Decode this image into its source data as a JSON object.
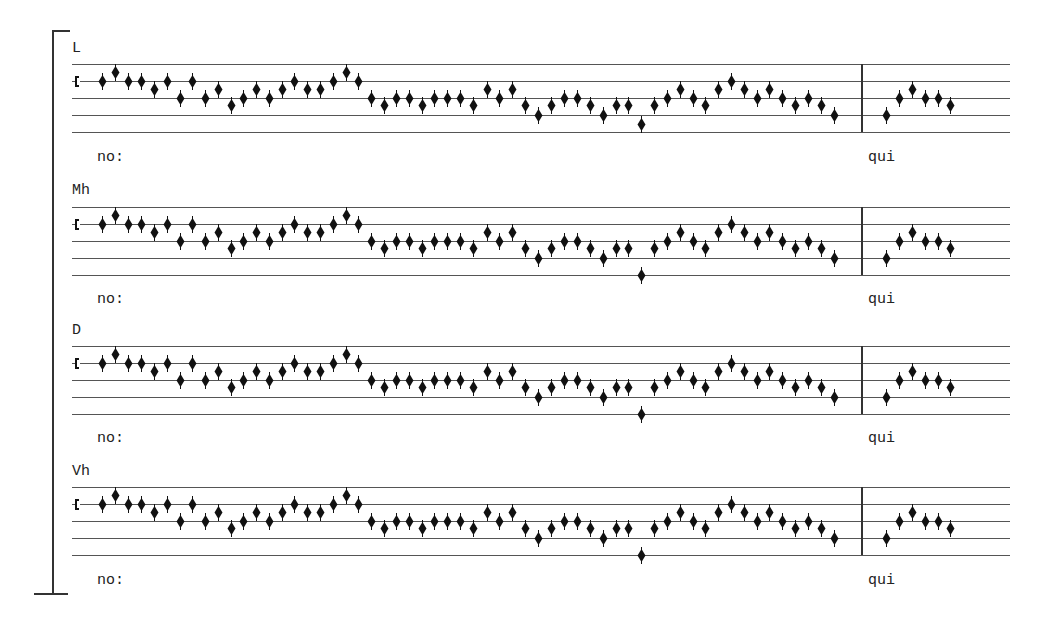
{
  "document": {
    "type": "chant-edition-comparison",
    "staff_line_offsets": [
      0,
      17,
      34,
      51,
      68
    ],
    "staff_left": 72,
    "staff_right": 1010,
    "barline_x": 861,
    "clef": {
      "type": "C-clef",
      "x": 77,
      "line_offset": 17
    },
    "ink_color": "#111111",
    "line_color": "#555555"
  },
  "systems": [
    {
      "label": "L",
      "top": 64,
      "label_y": 40,
      "lyric_y": 149,
      "lyrics": [
        {
          "text": "no:",
          "x": 97
        },
        {
          "text": "qui",
          "x": 868
        }
      ],
      "variant_note": {
        "x": 641,
        "offset": 60
      }
    },
    {
      "label": "Mh",
      "top": 207,
      "label_y": 182,
      "lyric_y": 291,
      "lyrics": [
        {
          "text": "no:",
          "x": 97
        },
        {
          "text": "qui",
          "x": 868
        }
      ],
      "variant_note": {
        "x": 641,
        "offset": 68
      }
    },
    {
      "label": "D",
      "top": 346,
      "label_y": 322,
      "lyric_y": 430,
      "lyrics": [
        {
          "text": "no:",
          "x": 97
        },
        {
          "text": "qui",
          "x": 868
        }
      ],
      "variant_note": {
        "x": 641,
        "offset": 68
      }
    },
    {
      "label": "Vh",
      "top": 487,
      "label_y": 463,
      "lyric_y": 572,
      "lyrics": [
        {
          "text": "no:",
          "x": 97
        },
        {
          "text": "qui",
          "x": 868
        }
      ],
      "variant_note": {
        "x": 641,
        "offset": 68
      }
    }
  ],
  "melody": [
    [
      102,
      17
    ],
    [
      115,
      8
    ],
    [
      128,
      17
    ],
    [
      141,
      17
    ],
    [
      154,
      25
    ],
    [
      167,
      17
    ],
    [
      180,
      34
    ],
    [
      192,
      17
    ],
    [
      205,
      34
    ],
    [
      218,
      25
    ],
    [
      231,
      41
    ],
    [
      243,
      34
    ],
    [
      256,
      25
    ],
    [
      269,
      34
    ],
    [
      282,
      25
    ],
    [
      294,
      17
    ],
    [
      307,
      25
    ],
    [
      320,
      25
    ],
    [
      333,
      17
    ],
    [
      346,
      8
    ],
    [
      358,
      17
    ],
    [
      371,
      34
    ],
    [
      384,
      41
    ],
    [
      396,
      34
    ],
    [
      409,
      34
    ],
    [
      422,
      41
    ],
    [
      434,
      34
    ],
    [
      447,
      34
    ],
    [
      460,
      34
    ],
    [
      473,
      41
    ],
    [
      487,
      25
    ],
    [
      499,
      34
    ],
    [
      512,
      25
    ],
    [
      525,
      41
    ],
    [
      538,
      51
    ],
    [
      551,
      41
    ],
    [
      564,
      34
    ],
    [
      577,
      34
    ],
    [
      590,
      41
    ],
    [
      603,
      51
    ],
    [
      616,
      41
    ],
    [
      628,
      41
    ],
    [
      "VAR"
    ],
    [
      654,
      41
    ],
    [
      667,
      34
    ],
    [
      680,
      25
    ],
    [
      693,
      34
    ],
    [
      705,
      41
    ],
    [
      718,
      25
    ],
    [
      731,
      17
    ],
    [
      744,
      25
    ],
    [
      757,
      34
    ],
    [
      769,
      25
    ],
    [
      782,
      34
    ],
    [
      795,
      41
    ],
    [
      808,
      34
    ],
    [
      821,
      41
    ],
    [
      834,
      51
    ],
    [
      886,
      51
    ],
    [
      899,
      34
    ],
    [
      912,
      25
    ],
    [
      925,
      34
    ],
    [
      938,
      34
    ],
    [
      950,
      41
    ]
  ]
}
